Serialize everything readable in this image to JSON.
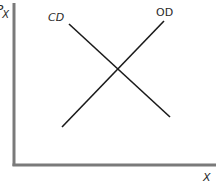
{
  "diagram": {
    "type": "supply-demand-cross",
    "axes": {
      "y_label_main": "P",
      "y_label_sub": "X",
      "x_label": "X",
      "axis_color": "#7a7a7a"
    },
    "curves": [
      {
        "name": "CD",
        "label": "CD",
        "slope": "downward",
        "color": "#1a1a1a"
      },
      {
        "name": "OD",
        "label": "OD",
        "slope": "upward",
        "color": "#1a1a1a"
      }
    ],
    "intersection": "equilibrium"
  }
}
